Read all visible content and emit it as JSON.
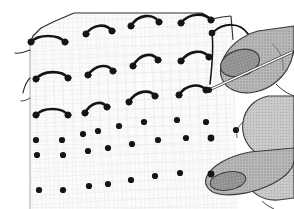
{
  "illustration": {
    "title": "Hand stitching curved stitches on dotted fabric grid",
    "caption": "",
    "subject": "embroidery-hand-with-needle",
    "style": "line-art-halftone"
  },
  "colors": {
    "background": "#ffffff",
    "fabric_fill": "#fbfbfb",
    "fabric_grid_line": "#e6e6e6",
    "fabric_edge": "#2b2b2b",
    "stitch_thread": "#141414",
    "dot": "#141414",
    "hand_light": "#b9b9b9",
    "hand_mid": "#9a9a9a",
    "hand_dark": "#7e7e7e",
    "hand_outline": "#3a3a3a",
    "nail_fill": "#aeaeae",
    "needle_fill": "#f2f2f2",
    "needle_outline": "#2b2b2b"
  },
  "fabric": {
    "name": "gridded-fabric-sheet",
    "grid_spacing_px": 9,
    "edge_points": "top-left-corner, top-right-corner, left-selvedge",
    "loose_threads": 2
  },
  "stitches": {
    "label": "completed-curved-stitches",
    "count": 12,
    "rows": 3,
    "columns": 4,
    "items": [
      {
        "id": "s-r1-c1",
        "x1": 31,
        "y1": 42,
        "x2": 65,
        "y2": 42,
        "bow": -9
      },
      {
        "id": "s-r1-c2",
        "x1": 86,
        "y1": 33,
        "x2": 112,
        "y2": 31,
        "bow": -9
      },
      {
        "id": "s-r1-c3",
        "x1": 131,
        "y1": 25,
        "x2": 159,
        "y2": 22,
        "bow": -9
      },
      {
        "id": "s-r1-c4",
        "x1": 181,
        "y1": 22,
        "x2": 211,
        "y2": 20,
        "bow": -9
      },
      {
        "id": "s-r2-c1",
        "x1": 36,
        "y1": 79,
        "x2": 68,
        "y2": 78,
        "bow": -9
      },
      {
        "id": "s-r2-c2",
        "x1": 88,
        "y1": 74,
        "x2": 113,
        "y2": 71,
        "bow": -9
      },
      {
        "id": "s-r2-c3",
        "x1": 133,
        "y1": 65,
        "x2": 158,
        "y2": 60,
        "bow": -9
      },
      {
        "id": "s-r2-c4",
        "x1": 181,
        "y1": 60,
        "x2": 209,
        "y2": 57,
        "bow": -9
      },
      {
        "id": "s-r3-c1",
        "x1": 36,
        "y1": 115,
        "x2": 68,
        "y2": 115,
        "bow": -9
      },
      {
        "id": "s-r3-c2",
        "x1": 85,
        "y1": 112,
        "x2": 107,
        "y2": 107,
        "bow": -9
      },
      {
        "id": "s-r3-c3",
        "x1": 129,
        "y1": 101,
        "x2": 155,
        "y2": 96,
        "bow": -9
      },
      {
        "id": "s-r3-c4",
        "x1": 179,
        "y1": 94,
        "x2": 206,
        "y2": 90,
        "bow": -9
      }
    ]
  },
  "dots": {
    "label": "marked-stitch-points",
    "count": 21,
    "radius_px": 3.1,
    "rows": [
      {
        "id": "dot-row-1",
        "points": [
          [
            36,
            140
          ],
          [
            62,
            140
          ],
          [
            83,
            134
          ],
          [
            98,
            131
          ],
          [
            119,
            126
          ],
          [
            144,
            122
          ],
          [
            177,
            120
          ],
          [
            206,
            122
          ],
          [
            236,
            130
          ]
        ]
      },
      {
        "id": "dot-row-2",
        "points": [
          [
            37,
            155
          ],
          [
            63,
            155
          ],
          [
            88,
            151
          ],
          [
            108,
            148
          ],
          [
            132,
            144
          ],
          [
            158,
            140
          ],
          [
            186,
            138
          ],
          [
            211,
            138
          ]
        ]
      },
      {
        "id": "dot-row-3",
        "points": [
          [
            39,
            190
          ],
          [
            63,
            190
          ],
          [
            89,
            186
          ],
          [
            108,
            184
          ],
          [
            131,
            180
          ],
          [
            155,
            176
          ],
          [
            180,
            173
          ]
        ]
      }
    ]
  },
  "working_thread": {
    "label": "working-thread-from-needle",
    "anchor_dot": [
      212,
      33
    ],
    "description": "thread loops up over fabric edge and back to the needle eye"
  },
  "hand": {
    "label": "hand-holding-needle",
    "parts": [
      {
        "name": "index-finger",
        "state": "pressing-needle"
      },
      {
        "name": "index-fingernail",
        "state": "visible"
      },
      {
        "name": "middle-finger",
        "state": "supporting"
      },
      {
        "name": "thumb",
        "state": "pressing-fabric-dot"
      },
      {
        "name": "thumbnail",
        "state": "visible"
      }
    ]
  },
  "needle": {
    "label": "sewing-needle",
    "tip": [
      209,
      90
    ],
    "tail": [
      286,
      55
    ],
    "state": "held-between-fingers"
  }
}
